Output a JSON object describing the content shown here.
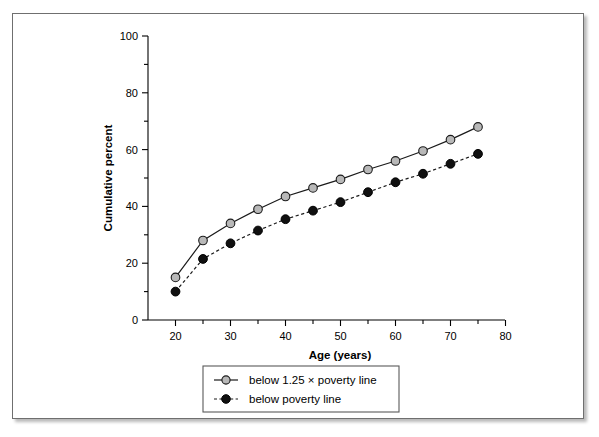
{
  "chart_data": {
    "type": "line",
    "title": "",
    "xlabel": "Age (years)",
    "ylabel": "Cumulative percent",
    "xlim": [
      15,
      80
    ],
    "ylim": [
      0,
      100
    ],
    "xticks": [
      20,
      30,
      40,
      50,
      60,
      70,
      80
    ],
    "xtick_labels": [
      "20",
      "30",
      "40",
      "50",
      "60",
      "70",
      "80"
    ],
    "xminor_ticks": [
      25,
      35,
      45,
      55,
      65,
      75
    ],
    "yticks": [
      0,
      20,
      40,
      60,
      80,
      100
    ],
    "ytick_labels": [
      "0",
      "20",
      "40",
      "60",
      "80",
      "100"
    ],
    "yminor_ticks": [
      10,
      30,
      50,
      70,
      90
    ],
    "grid": false,
    "legend_position": "below-axes",
    "x": [
      20,
      25,
      30,
      35,
      40,
      45,
      50,
      55,
      60,
      65,
      70,
      75
    ],
    "series": [
      {
        "name": "below 1.25 × poverty line",
        "marker": "open-circle",
        "marker_fill": "#b8b8b8",
        "line_style": "solid",
        "color": "#1a1a1a",
        "values": [
          15,
          28,
          34,
          39,
          43.5,
          46.5,
          49.5,
          53,
          56,
          59.5,
          63.5,
          68
        ]
      },
      {
        "name": "below poverty line",
        "marker": "filled-circle",
        "marker_fill": "#101010",
        "line_style": "dashed",
        "color": "#1a1a1a",
        "values": [
          10,
          21.5,
          27,
          31.5,
          35.5,
          38.5,
          41.5,
          45,
          48.5,
          51.5,
          55,
          58.5
        ]
      }
    ]
  },
  "legend": {
    "entries": [
      {
        "label": "below 1.25 × poverty line"
      },
      {
        "label": "below poverty line"
      }
    ]
  },
  "colors": {
    "open_marker_fill": "#b8b8b8",
    "filled_marker_fill": "#101010",
    "line": "#1a1a1a",
    "axis": "#000000",
    "frame_border": "#6f6f6f",
    "background": "#ffffff"
  }
}
